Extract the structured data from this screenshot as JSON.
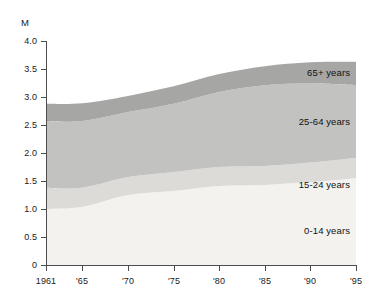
{
  "chart_data": {
    "type": "area",
    "stacked": true,
    "title": "",
    "subtitle": "",
    "xlabel": "",
    "ylabel": "M",
    "unit_label": "M",
    "xlim": [
      1961,
      1995
    ],
    "ylim": [
      0,
      4.0
    ],
    "grid": false,
    "legend_position": "inline-right",
    "y_ticks": [
      "4.0",
      "3.5",
      "3.0",
      "2.5",
      "2.0",
      "1.5",
      "1.0",
      "0.5",
      "0"
    ],
    "y_tick_values": [
      4.0,
      3.5,
      3.0,
      2.5,
      2.0,
      1.5,
      1.0,
      0.5,
      0
    ],
    "x_ticks": [
      "1961",
      "'65",
      "'70",
      "'75",
      "'80",
      "'85",
      "'90",
      "'95"
    ],
    "x_tick_values": [
      1961,
      1965,
      1970,
      1975,
      1980,
      1985,
      1990,
      1995
    ],
    "x": [
      1961,
      1965,
      1970,
      1975,
      1980,
      1985,
      1990,
      1995
    ],
    "series": [
      {
        "name": "0-14 years",
        "color": "#f3f2ef",
        "values": [
          1.0,
          1.04,
          1.25,
          1.32,
          1.41,
          1.43,
          1.48,
          1.55
        ]
      },
      {
        "name": "15-24 years",
        "color": "#dcdbd8",
        "values": [
          0.38,
          0.34,
          0.32,
          0.34,
          0.34,
          0.34,
          0.35,
          0.36
        ]
      },
      {
        "name": "25-64 years",
        "color": "#c2c2c0",
        "values": [
          1.19,
          1.19,
          1.16,
          1.22,
          1.34,
          1.44,
          1.41,
          1.3
        ]
      },
      {
        "name": "65+ years",
        "color": "#a6a6a4",
        "values": [
          0.31,
          0.32,
          0.29,
          0.31,
          0.32,
          0.34,
          0.38,
          0.42
        ]
      }
    ],
    "cumulative_totals": [
      2.88,
      2.89,
      3.02,
      3.19,
      3.41,
      3.55,
      3.62,
      3.63
    ],
    "annotations": [
      {
        "text": "65+ years",
        "x_px": 350,
        "y_px": 73
      },
      {
        "text": "25-64 years",
        "x_px": 350,
        "y_px": 122
      },
      {
        "text": "15-24 years",
        "x_px": 350,
        "y_px": 185
      },
      {
        "text": "0-14 years",
        "x_px": 350,
        "y_px": 231
      }
    ],
    "axis_color": "#4d4d4d",
    "background_color": "#ffffff"
  }
}
